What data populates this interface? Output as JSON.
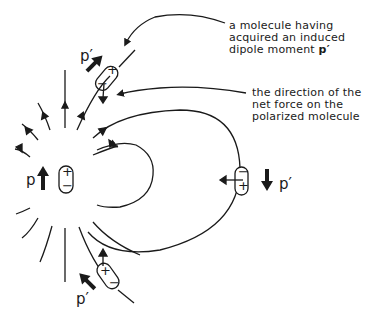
{
  "diagram": {
    "type": "electric field of a dipole acting on polarized molecules",
    "annotations": {
      "induced_dipole": {
        "line1": "a molecule having",
        "line2": "acquired an induced",
        "line3_text": "dipole moment ",
        "line3_symbol": "p′"
      },
      "net_force": {
        "line1": "the direction of the",
        "line2": "net force on the",
        "line3": "polarized molecule"
      }
    },
    "source_dipole": {
      "label": "p",
      "top_charge": "+",
      "bottom_charge": "−"
    },
    "molecules": [
      {
        "position": "upper",
        "label": "p′",
        "charge_a": "+",
        "charge_b": "−"
      },
      {
        "position": "right",
        "label": "p′",
        "charge_a": "−",
        "charge_b": "+"
      },
      {
        "position": "lower",
        "label": "p′",
        "charge_a": "+",
        "charge_b": "−"
      }
    ],
    "colors": {
      "ink": "#1a1a1a",
      "background": "#ffffff"
    }
  }
}
